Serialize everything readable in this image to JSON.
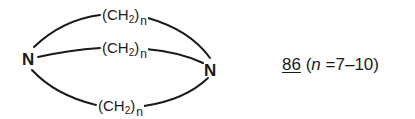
{
  "diagram": {
    "type": "chemical-structure",
    "atoms": {
      "left_n": "N",
      "right_n": "N"
    },
    "bridges": [
      {
        "prefix": "(CH",
        "sub": "2",
        "suffix": ")",
        "index": "n"
      },
      {
        "prefix": "(CH",
        "sub": "2",
        "suffix": ")",
        "index": "n"
      },
      {
        "prefix": "(CH",
        "sub": "2",
        "suffix": ")",
        "index": "n"
      }
    ],
    "caption": {
      "compound_number": "86",
      "open_paren": "(",
      "variable": "n",
      "equals": "=",
      "range": "7–10",
      "close_paren": ")"
    },
    "colors": {
      "ink": "#1a1a1a",
      "background": "#ffffff"
    }
  }
}
